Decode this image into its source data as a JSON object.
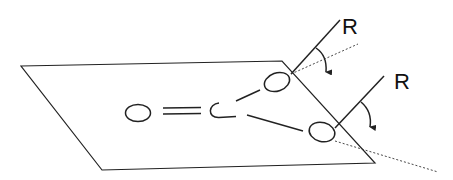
{
  "diagram": {
    "labels": {
      "r_upper": "R",
      "r_lower": "R"
    },
    "atoms": [
      {
        "id": "oxygen",
        "symbol": "O"
      },
      {
        "id": "carbon",
        "symbol": "C"
      },
      {
        "id": "substituent-upper",
        "symbol": ""
      },
      {
        "id": "substituent-lower",
        "symbol": ""
      }
    ],
    "bonds": [
      {
        "from": "oxygen",
        "to": "carbon",
        "order": 2
      },
      {
        "from": "carbon",
        "to": "substituent-upper",
        "order": 1
      },
      {
        "from": "carbon",
        "to": "substituent-lower",
        "order": 1
      }
    ],
    "rotations": [
      {
        "about": "substituent-upper",
        "group": "R",
        "direction": "clockwise-down"
      },
      {
        "about": "substituent-lower",
        "group": "R",
        "direction": "clockwise-down"
      }
    ]
  }
}
